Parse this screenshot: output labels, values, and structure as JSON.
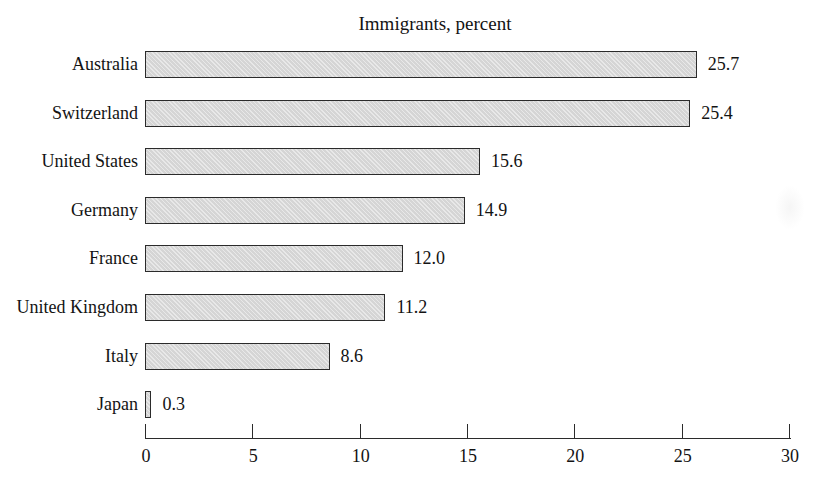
{
  "chart_data": {
    "type": "bar",
    "orientation": "horizontal",
    "title": "Immigrants, percent",
    "categories": [
      "Australia",
      "Switzerland",
      "United States",
      "Germany",
      "France",
      "United Kingdom",
      "Italy",
      "Japan"
    ],
    "values": [
      25.7,
      25.4,
      15.6,
      14.9,
      12.0,
      11.2,
      8.6,
      0.3
    ],
    "value_labels": [
      "25.7",
      "25.4",
      "15.6",
      "14.9",
      "12.0",
      "11.2",
      "8.6",
      "0.3"
    ],
    "xlabel": "",
    "ylabel": "",
    "xlim": [
      0,
      30
    ],
    "x_ticks": [
      0,
      5,
      10,
      15,
      20,
      25,
      30
    ],
    "grid": false,
    "legend": false,
    "bar_fill": "#dcdcdc",
    "bar_border": "#2b2b2b",
    "text_color": "#131313"
  }
}
